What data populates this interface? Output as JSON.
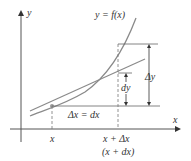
{
  "diagram": {
    "curve_label": "y = f(x)",
    "axes": {
      "x_label": "x",
      "y_label": "y"
    },
    "tick_labels": {
      "x": "x",
      "x_plus_dx": "x + Δx",
      "x_plus_dx_alt": "(x + dx)"
    },
    "annotations": {
      "delta_x": "Δx = dx",
      "delta_y": "Δy",
      "dy": "dy"
    },
    "colors": {
      "curve": "#8a8a8a",
      "tangent": "#8a8a8a",
      "axes": "#555555",
      "guides": "#777777",
      "point": "#9a9a9a"
    }
  }
}
